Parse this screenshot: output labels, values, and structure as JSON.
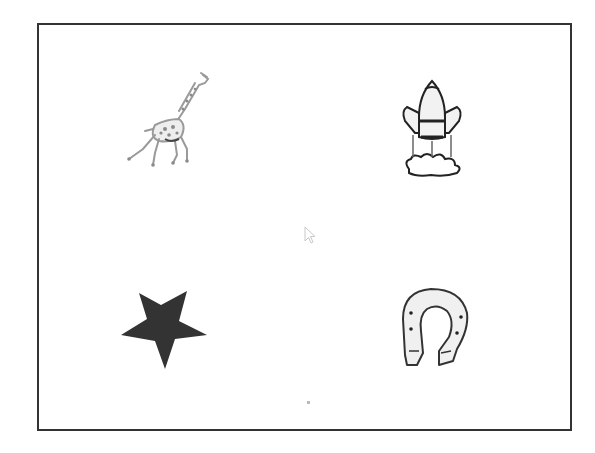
{
  "screen": {
    "background": "#ffffff",
    "frame_border_color": "#333333"
  },
  "grid": {
    "items": [
      {
        "id": "giraffe",
        "icon": "giraffe-icon",
        "position": "top-left",
        "style": "light gray spotted line drawing"
      },
      {
        "id": "rocket",
        "icon": "rocket-icon",
        "position": "top-right",
        "style": "black outline with clouds"
      },
      {
        "id": "star",
        "icon": "star-icon",
        "position": "bottom-left",
        "style": "solid dark fill",
        "color": "#333333"
      },
      {
        "id": "horseshoe",
        "icon": "horseshoe-icon",
        "position": "bottom-right",
        "style": "outline with nail holes"
      }
    ]
  },
  "cursor": {
    "icon": "mouse-pointer-icon",
    "x": 305,
    "y": 232
  }
}
